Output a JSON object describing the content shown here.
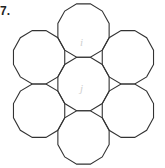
{
  "figure": {
    "problem_number": "7.",
    "shape": "regular dodecagon",
    "count": 7,
    "arrangement": "one central dodecagon surrounded by six dodecagons, triangular gaps between neighbors",
    "faint_labels": [
      "i",
      "j"
    ],
    "stroke_color": "#333333"
  }
}
